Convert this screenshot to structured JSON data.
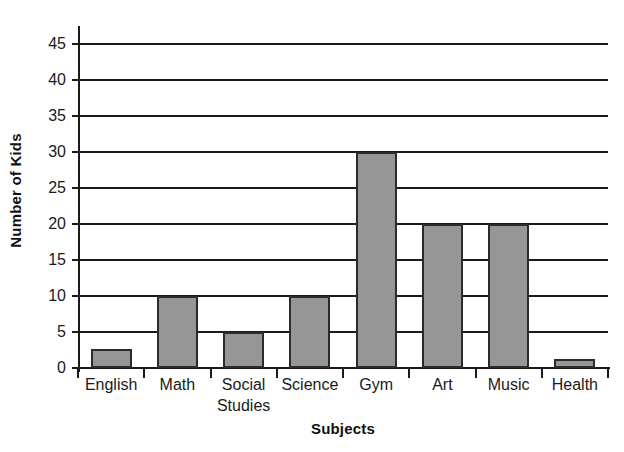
{
  "chart_data": {
    "type": "bar",
    "title": "",
    "xlabel": "Subjects",
    "ylabel": "Number of Kids",
    "categories": [
      "English",
      "Math",
      "Social Studies",
      "Science",
      "Gym",
      "Art",
      "Music",
      "Health"
    ],
    "category_label_lines": [
      [
        "English"
      ],
      [
        "Math"
      ],
      [
        "Social",
        "Studies"
      ],
      [
        "Science"
      ],
      [
        "Gym"
      ],
      [
        "Art"
      ],
      [
        "Music"
      ],
      [
        "Health"
      ]
    ],
    "values": [
      2.7,
      10,
      5,
      10,
      30,
      20,
      20,
      1.2
    ],
    "ylim": [
      0,
      47
    ],
    "yticks": [
      0,
      5,
      10,
      15,
      20,
      25,
      30,
      35,
      40,
      45
    ],
    "ytick_labels": [
      "0",
      "5",
      "10",
      "15",
      "20",
      "25",
      "30",
      "35",
      "40",
      "45"
    ],
    "grid": true,
    "grid_axis": "y",
    "legend": false,
    "bar_fill_color": "#969696",
    "bar_edge_color": "#2b2b2b",
    "axis_color": "#1a1a1a",
    "background_color": "#ffffff"
  }
}
